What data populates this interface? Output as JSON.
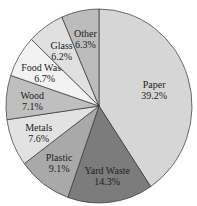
{
  "chart_data": {
    "type": "pie",
    "title": "",
    "start_angle_deg": 0,
    "direction": "clockwise",
    "slices": [
      {
        "label": "Paper",
        "value": 39.2,
        "display": "39.2%",
        "color": "#d6d6d6"
      },
      {
        "label": "Yard Waste",
        "value": 14.3,
        "display": "14.3%",
        "color": "#7c7c7c"
      },
      {
        "label": "Plastic",
        "value": 9.1,
        "display": "9.1%",
        "color": "#a9a9a9"
      },
      {
        "label": "Metals",
        "value": 7.6,
        "display": "7.6%",
        "color": "#e2e2e2"
      },
      {
        "label": "Wood",
        "value": 7.1,
        "display": "7.1%",
        "color": "#bfbfbf"
      },
      {
        "label": "Food Waste",
        "value": 6.7,
        "display": "6.7%",
        "color": "#f2f2f2"
      },
      {
        "label": "Glass",
        "value": 6.2,
        "display": "6.2%",
        "color": "#e0e0e0"
      },
      {
        "label": "Other",
        "value": 6.3,
        "display": "6.3%",
        "color": "#bcbcbc"
      }
    ]
  }
}
